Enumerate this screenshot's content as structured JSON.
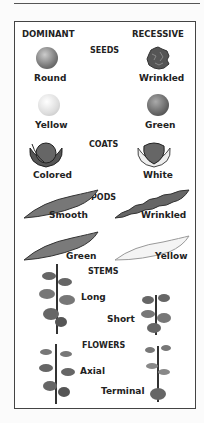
{
  "headers": {
    "dominant": "DOMINANT",
    "recessive": "RECESSIVE"
  },
  "traits": [
    {
      "category": "SEEDS",
      "dominant": "Round",
      "recessive": "Wrinkled"
    },
    {
      "category": "",
      "dominant": "Yellow",
      "recessive": "Green"
    },
    {
      "category": "COATS",
      "dominant": "Colored",
      "recessive": "White"
    },
    {
      "category": "PODS",
      "dominant": "Smooth",
      "recessive": "Wrinkled"
    },
    {
      "category": "",
      "dominant": "Green",
      "recessive": "Yellow"
    },
    {
      "category": "STEMS",
      "dominant": "Long",
      "recessive": "Short"
    },
    {
      "category": "FLOWERS",
      "dominant": "Axial",
      "recessive": "Terminal"
    }
  ]
}
